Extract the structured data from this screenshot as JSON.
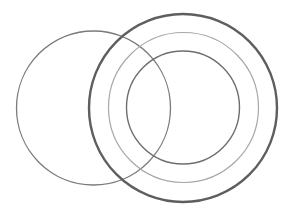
{
  "diagram": {
    "background": "#ffffff",
    "circles": [
      {
        "id": "left-circle",
        "cx": 93.5,
        "cy": 108,
        "r": 77,
        "stroke": "#7a7a7a",
        "width": 1.3
      },
      {
        "id": "outer-circle",
        "cx": 183,
        "cy": 108,
        "r": 94,
        "stroke": "#5e5e5e",
        "width": 2.4
      },
      {
        "id": "middle-circle",
        "cx": 183.5,
        "cy": 107.5,
        "r": 75,
        "stroke": "#a8a8a8",
        "width": 1.2
      },
      {
        "id": "inner-circle",
        "cx": 183,
        "cy": 107.5,
        "r": 56.5,
        "stroke": "#6e6e6e",
        "width": 1.4
      }
    ]
  }
}
